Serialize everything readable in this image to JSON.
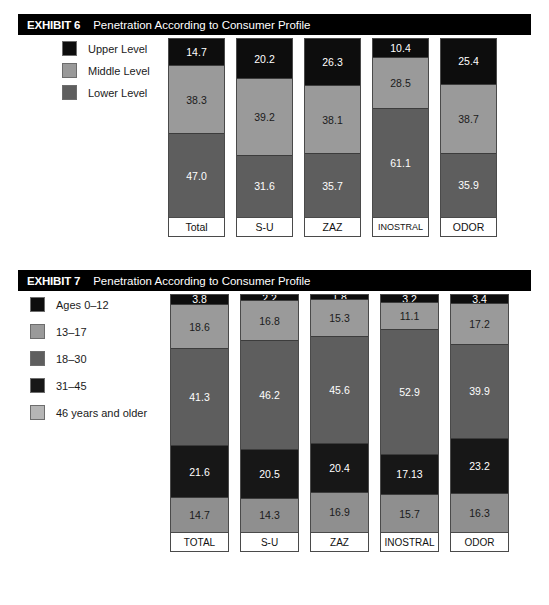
{
  "exhibit6": {
    "number_label": "EXHIBIT 6",
    "title": "Penetration According to Consumer Profile",
    "legend": [
      {
        "label": "Upper Level",
        "color": "#0d0d0d"
      },
      {
        "label": "Middle Level",
        "color": "#9a9a9a"
      },
      {
        "label": "Lower Level",
        "color": "#5e5e5e"
      }
    ],
    "chart_data": {
      "type": "bar",
      "stacked": true,
      "title": "Penetration According to Consumer Profile",
      "xlabel": "",
      "ylabel": "",
      "ylim": [
        0,
        100
      ],
      "grid": false,
      "legend_position": "left",
      "categories": [
        "Total",
        "S-U",
        "ZAZ",
        "INOSTRAL",
        "ODOR"
      ],
      "series": [
        {
          "name": "Upper Level",
          "color": "#0d0d0d",
          "values": [
            14.7,
            20.2,
            26.3,
            10.4,
            25.4
          ]
        },
        {
          "name": "Middle Level",
          "color": "#9a9a9a",
          "values": [
            38.3,
            39.2,
            38.1,
            28.5,
            38.7
          ]
        },
        {
          "name": "Lower Level",
          "color": "#5e5e5e",
          "values": [
            47.0,
            31.6,
            35.7,
            61.1,
            35.9
          ]
        }
      ],
      "value_labels": [
        [
          "14.7",
          "38.3",
          "47.0"
        ],
        [
          "20.2",
          "39.2",
          "31.6"
        ],
        [
          "26.3",
          "38.1",
          "35.7"
        ],
        [
          "10.4",
          "28.5",
          "61.1"
        ],
        [
          "25.4",
          "38.7",
          "35.9"
        ]
      ]
    }
  },
  "exhibit7": {
    "number_label": "EXHIBIT 7",
    "title": "Penetration According to Consumer Profile",
    "legend": [
      {
        "label": "Ages 0–12",
        "color": "#0d0d0d"
      },
      {
        "label": "13–17",
        "color": "#9a9a9a"
      },
      {
        "label": "18–30",
        "color": "#5e5e5e"
      },
      {
        "label": "31–45",
        "color": "#171717"
      },
      {
        "label": "46 years and older",
        "color": "#b5b5b5"
      }
    ],
    "chart_data": {
      "type": "bar",
      "stacked": true,
      "title": "Penetration According to Consumer Profile",
      "xlabel": "",
      "ylabel": "",
      "ylim": [
        0,
        100
      ],
      "grid": false,
      "legend_position": "left",
      "categories": [
        "TOTAL",
        "S-U",
        "ZAZ",
        "INOSTRAL",
        "ODOR"
      ],
      "series": [
        {
          "name": "Ages 0–12",
          "color": "#0d0d0d",
          "values": [
            3.8,
            2.2,
            1.8,
            3.2,
            3.4
          ]
        },
        {
          "name": "13–17",
          "color": "#9a9a9a",
          "values": [
            18.6,
            16.8,
            15.3,
            11.1,
            17.2
          ]
        },
        {
          "name": "18–30",
          "color": "#5e5e5e",
          "values": [
            41.3,
            46.2,
            45.6,
            52.9,
            39.9
          ]
        },
        {
          "name": "31–45",
          "color": "#171717",
          "values": [
            21.6,
            20.5,
            20.4,
            17.13,
            23.2
          ]
        },
        {
          "name": "46 years and older",
          "color": "#8f8f8f",
          "values": [
            14.7,
            14.3,
            16.9,
            15.7,
            16.3
          ]
        }
      ],
      "value_labels": [
        [
          "3.8",
          "18.6",
          "41.3",
          "21.6",
          "14.7"
        ],
        [
          "2.2",
          "16.8",
          "46.2",
          "20.5",
          "14.3"
        ],
        [
          "1.8",
          "15.3",
          "45.6",
          "20.4",
          "16.9"
        ],
        [
          "3.2",
          "11.1",
          "52.9",
          "17.13",
          "15.7"
        ],
        [
          "3.4",
          "17.2",
          "39.9",
          "23.2",
          "16.3"
        ]
      ]
    }
  }
}
